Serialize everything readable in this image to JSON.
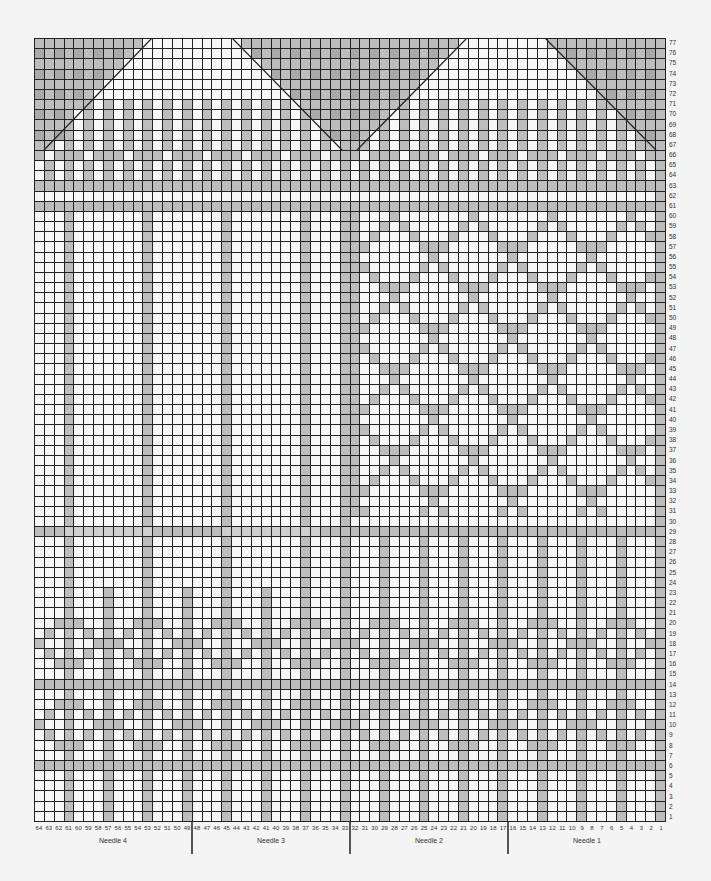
{
  "chart": {
    "title": "",
    "columns": 64,
    "rows": 77,
    "colors": {
      "background": "#f4f4f4",
      "white_cell": "#f7f7f7",
      "gray_cell": "#bdbdbd",
      "dark_gray_cell": "#a9a9a9",
      "light_gray_cell": "#cfcfcf",
      "grid_line": "#222222"
    },
    "row_labels": [
      "77",
      "76",
      "75",
      "74",
      "73",
      "72",
      "71",
      "70",
      "69",
      "68",
      "67",
      "66",
      "65",
      "64",
      "63",
      "62",
      "61",
      "60",
      "59",
      "58",
      "57",
      "56",
      "55",
      "54",
      "53",
      "52",
      "51",
      "50",
      "49",
      "48",
      "47",
      "46",
      "45",
      "44",
      "43",
      "42",
      "41",
      "40",
      "39",
      "38",
      "37",
      "36",
      "35",
      "34",
      "33",
      "32",
      "31",
      "30",
      "29",
      "28",
      "27",
      "26",
      "25",
      "24",
      "23",
      "22",
      "21",
      "20",
      "19",
      "18",
      "17",
      "16",
      "15",
      "14",
      "13",
      "12",
      "11",
      "10",
      "9",
      "8",
      "7",
      "6",
      "5",
      "4",
      "3",
      "2",
      "1"
    ],
    "column_labels": [
      "64",
      "63",
      "62",
      "61",
      "60",
      "59",
      "58",
      "57",
      "56",
      "55",
      "54",
      "53",
      "52",
      "51",
      "50",
      "49",
      "48",
      "47",
      "46",
      "45",
      "44",
      "43",
      "42",
      "41",
      "40",
      "39",
      "38",
      "37",
      "36",
      "35",
      "34",
      "33",
      "32",
      "31",
      "30",
      "29",
      "28",
      "27",
      "26",
      "25",
      "24",
      "23",
      "22",
      "21",
      "20",
      "19",
      "18",
      "17",
      "16",
      "15",
      "14",
      "13",
      "12",
      "11",
      "10",
      "9",
      "8",
      "7",
      "6",
      "5",
      "4",
      "3",
      "2",
      "1"
    ],
    "needles": [
      {
        "label": "Needle 4",
        "from": 64,
        "to": 49
      },
      {
        "label": "Needle 3",
        "from": 48,
        "to": 33
      },
      {
        "label": "Needle 2",
        "from": 32,
        "to": 17
      },
      {
        "label": "Needle 1",
        "from": 16,
        "to": 1
      }
    ],
    "shaping_lines": [
      {
        "x1": 10,
        "y1": 112,
        "x2": 118,
        "y2": 0
      },
      {
        "x1": 198,
        "y1": 0,
        "x2": 308,
        "y2": 112
      },
      {
        "x1": 323,
        "y1": 112,
        "x2": 433,
        "y2": 0
      },
      {
        "x1": 511,
        "y1": 0,
        "x2": 622,
        "y2": 112
      }
    ],
    "legend_key": {
      "g": "contrast color (gray)",
      ".": "main color (white)",
      "l": "light gray"
    }
  },
  "chart_data": {
    "type": "heatmap",
    "xlabel": "Stitch number (Needle 4 · Needle 3 · Needle 2 · Needle 1)",
    "ylabel": "Round",
    "x_range": [
      64,
      1
    ],
    "y_range": [
      1,
      77
    ],
    "needles": [
      "Needle 4",
      "Needle 3",
      "Needle 2",
      "Needle 1"
    ],
    "stitches_per_needle": 16,
    "features": {
      "top_decrease_triangles_rows": [
        67,
        77
      ],
      "full_contrast_bands_rows": [
        6,
        14,
        61,
        63
      ],
      "vertical_stripe_columns_lower": [
        61,
        57,
        53,
        49,
        45,
        41,
        37,
        33,
        29,
        25,
        21,
        17,
        13,
        9,
        5,
        1
      ],
      "lattice_region": {
        "columns": [
          32,
          1
        ],
        "rows": [
          31,
          60
        ]
      },
      "light_band_row": 29
    }
  }
}
